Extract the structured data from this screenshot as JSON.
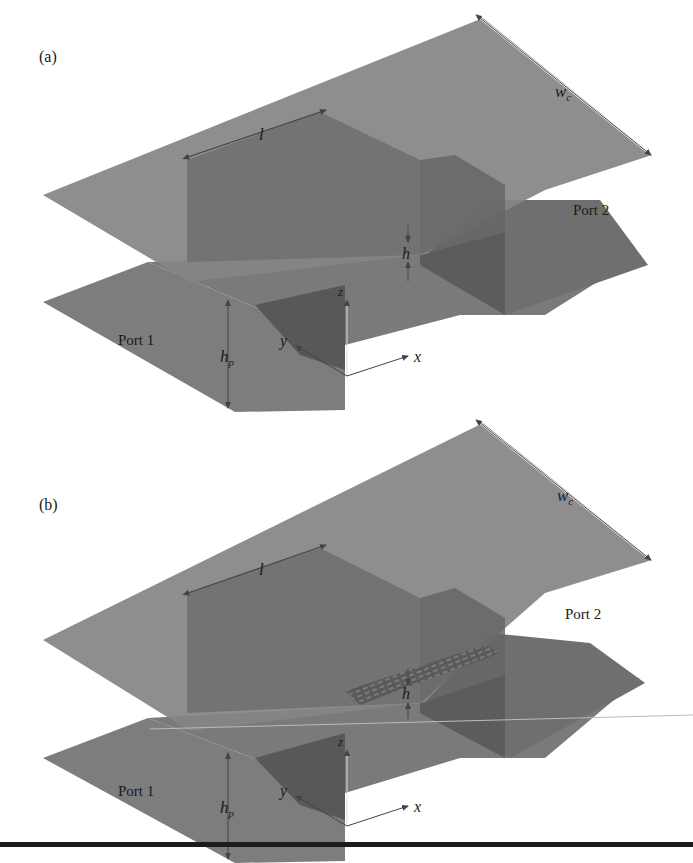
{
  "figure": {
    "panels": [
      {
        "id": "a",
        "label": "(a)",
        "dimension_labels": {
          "length": "l",
          "width": "w",
          "width_sub": "c",
          "gap": "h",
          "port_height": "h",
          "port_height_sub": "p"
        },
        "ports": [
          "Port 1",
          "Port 2"
        ],
        "axes": {
          "x": "x",
          "y": "y",
          "z": "z"
        },
        "textured_gap": false
      },
      {
        "id": "b",
        "label": "(b)",
        "dimension_labels": {
          "length": "l",
          "width": "w",
          "width_sub": "c",
          "gap": "h",
          "port_height": "h",
          "port_height_sub": "p"
        },
        "ports": [
          "Port 1",
          "Port 2"
        ],
        "axes": {
          "x": "x",
          "y": "y",
          "z": "z"
        },
        "textured_gap": true
      }
    ],
    "colors": {
      "plate": "#7b7b7b",
      "plate_dark": "#5e5e5e",
      "block_side": "#6a6a6a",
      "block_shadow": "#555555",
      "arrow": "#444444",
      "rule": "#1c1c1c"
    }
  }
}
